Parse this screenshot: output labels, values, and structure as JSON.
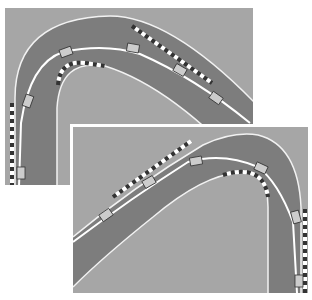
{
  "figure": {
    "colors": {
      "grass": "#a6a6a6",
      "track": "#7d7d7d",
      "edge_line": "#f2f2f2",
      "racing_line": "#ffffff",
      "kerb_dark": "#333333",
      "kerb_light": "#ffffff",
      "car": "#d9d9d9"
    },
    "panels": [
      {
        "id": "panel-1",
        "corner_direction": "left-hand hairpin (car enters from top-right, exits bottom-left)",
        "car_positions": 6
      },
      {
        "id": "panel-2",
        "corner_direction": "right-hand hairpin (car enters from bottom-left, exits bottom-right)",
        "car_positions": 6
      }
    ]
  }
}
